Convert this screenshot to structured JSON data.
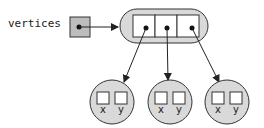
{
  "diagram": {
    "variable_label": "vertices",
    "array_cells": 3,
    "objects": [
      {
        "fields": [
          "x",
          "y"
        ]
      },
      {
        "fields": [
          "x",
          "y"
        ]
      },
      {
        "fields": [
          "x",
          "y"
        ]
      }
    ],
    "colors": {
      "fill": "#d9d9d9",
      "stroke": "#333333",
      "cell_fill": "#ffffff",
      "background": "#ffffff"
    }
  }
}
